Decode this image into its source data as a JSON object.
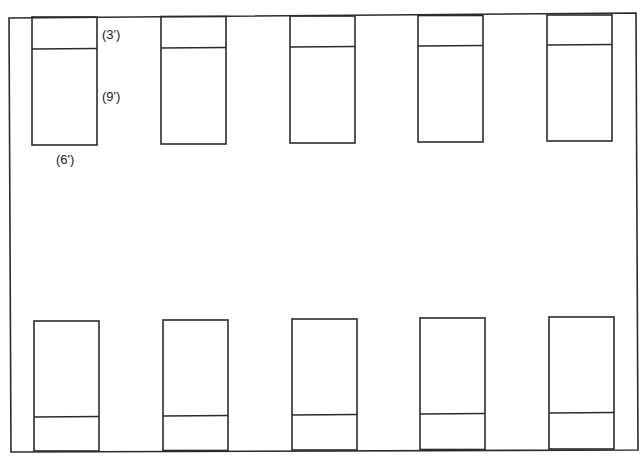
{
  "diagram": {
    "type": "floor-plan",
    "rows": [
      {
        "name": "top-row",
        "bed_count": 5,
        "pillow_side": "top"
      },
      {
        "name": "bottom-row",
        "bed_count": 5,
        "pillow_side": "bottom"
      }
    ],
    "dimension_labels": {
      "headboard_section": "(3')",
      "bed_length": "(9')",
      "bed_width": "(6')"
    },
    "line_color": "#2b2b2b"
  }
}
